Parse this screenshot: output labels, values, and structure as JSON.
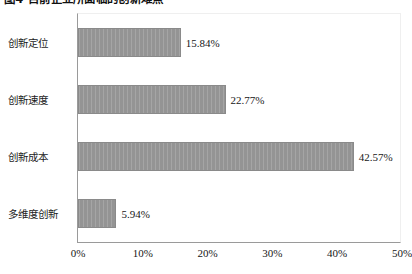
{
  "figure": {
    "title": "图4 目前企业所面临的创新难点"
  },
  "axis": {
    "x_ticks": [
      "0%",
      "10%",
      "20%",
      "30%",
      "40%",
      "50%"
    ]
  },
  "chart_data": {
    "type": "bar",
    "orientation": "horizontal",
    "title": "图4 目前企业所面临的创新难点",
    "xlabel": "",
    "ylabel": "",
    "xlim": [
      0,
      50
    ],
    "x_tick_labels": [
      "0%",
      "10%",
      "20%",
      "30%",
      "40%",
      "50%"
    ],
    "x_tick_values": [
      0,
      10,
      20,
      30,
      40,
      50
    ],
    "grid": false,
    "legend": false,
    "bar_color": "#949494",
    "categories": [
      "创新定位",
      "创新速度",
      "创新成本",
      "多维度创新"
    ],
    "values": [
      15.84,
      22.77,
      42.57,
      5.94
    ],
    "data_labels": [
      "15.84%",
      "22.77%",
      "42.57%",
      "5.94%"
    ]
  }
}
